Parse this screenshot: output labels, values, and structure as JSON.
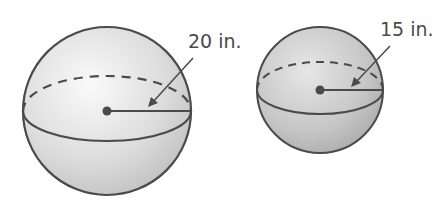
{
  "spheres": [
    {
      "name": "large-sphere",
      "radius_label": "20 in.",
      "radius_value": 20,
      "unit": "in."
    },
    {
      "name": "small-sphere",
      "radius_label": "15 in.",
      "radius_value": 15,
      "unit": "in."
    }
  ],
  "colors": {
    "stroke": "#4a4a4a",
    "fill_light": "#f2f2f2",
    "fill_dark": "#bdbdbd",
    "text": "#4a4a4a"
  }
}
